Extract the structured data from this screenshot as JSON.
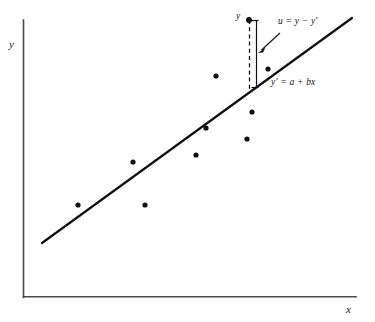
{
  "figure": {
    "kind": "scatter-with-regression-line",
    "background_color": "#ffffff",
    "axis_color": "#4a4a4a",
    "ink_color": "#111111"
  },
  "labels": {
    "y_axis": "y",
    "x_axis": "x",
    "observed_point": "y",
    "residual_equation": "u = y − y′",
    "line_equation": "y′ = a + bx"
  },
  "chart_data": {
    "type": "scatter",
    "title": "",
    "xlabel": "x",
    "ylabel": "y",
    "grid": false,
    "legend": "none",
    "axis_ticks": [],
    "xlim": [
      23,
      356
    ],
    "ylim": [
      20,
      297
    ],
    "note": "Axis ranges are unlabeled; values given in figure pixel space.",
    "points": [
      {
        "x": 78,
        "y": 205
      },
      {
        "x": 133,
        "y": 162
      },
      {
        "x": 145,
        "y": 205
      },
      {
        "x": 196,
        "y": 155
      },
      {
        "x": 206,
        "y": 128
      },
      {
        "x": 216,
        "y": 76
      },
      {
        "x": 247,
        "y": 139
      },
      {
        "x": 252,
        "y": 112
      },
      {
        "x": 268,
        "y": 69
      },
      {
        "x": 249,
        "y": 20
      }
    ],
    "fit_line": {
      "label": "y′ = a + bx",
      "x0": 42,
      "y0": 243,
      "x1": 352,
      "y1": 18
    },
    "residual_annotation": {
      "label": "u = y − y′",
      "point_x": 249,
      "point_y": 20,
      "line_y_at_point": 90,
      "bracket_x": 256,
      "bracket_top": 20,
      "bracket_bottom": 87
    }
  }
}
